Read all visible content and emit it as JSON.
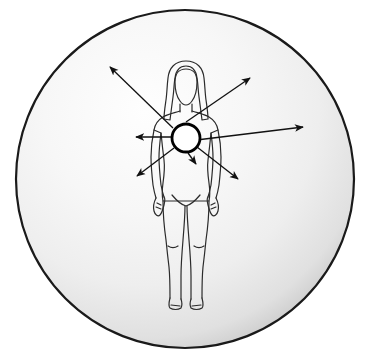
{
  "figure": {
    "kind": "anatomical-diagram",
    "canvas": {
      "width": 375,
      "height": 360,
      "background": "#ffffff"
    }
  },
  "aura_sphere": {
    "name": "aura-sphere",
    "center": {
      "x": 185,
      "y": 179
    },
    "radius": 169,
    "stroke_color": "#1a1a1a",
    "stroke_width": 2.2,
    "fill_light": "#fdfdfd",
    "fill_mid": "#f0f0f0",
    "fill_dark": "#c9c9c9",
    "highlight": {
      "x": 150,
      "y": 120
    }
  },
  "body_figure": {
    "name": "female-body-outline",
    "stroke_color": "#2b2b2b",
    "stroke_width": 1.2,
    "fill": "none",
    "head_center": {
      "x": 186,
      "y": 88
    },
    "feet_y": 308,
    "parts": [
      "head",
      "hair",
      "neck",
      "shoulders",
      "torso",
      "left-arm",
      "right-arm",
      "left-hand",
      "right-hand",
      "hips",
      "left-leg",
      "right-leg",
      "left-foot",
      "right-foot"
    ]
  },
  "energy_center": {
    "name": "solar-plexus-circle",
    "center": {
      "x": 186,
      "y": 138
    },
    "radius": 14,
    "stroke_color": "#000000",
    "stroke_width": 2.8,
    "fill": "#ffffff"
  },
  "rays": {
    "name": "radiating-arrows",
    "stroke_color": "#111111",
    "stroke_width": 1.3,
    "head_length": 8,
    "head_width": 5,
    "items": [
      {
        "id": "ray-upper-left",
        "label": "upper-left ray",
        "from": {
          "x": 173,
          "y": 128
        },
        "to": {
          "x": 110,
          "y": 67
        }
      },
      {
        "id": "ray-left",
        "label": "left ray",
        "from": {
          "x": 171,
          "y": 137
        },
        "to": {
          "x": 136,
          "y": 137
        }
      },
      {
        "id": "ray-lower-left",
        "label": "lower-left ray",
        "from": {
          "x": 174,
          "y": 148
        },
        "to": {
          "x": 137,
          "y": 176
        }
      },
      {
        "id": "ray-down",
        "label": "downward ray",
        "from": {
          "x": 188,
          "y": 153
        },
        "to": {
          "x": 196,
          "y": 164
        }
      },
      {
        "id": "ray-lower-right",
        "label": "lower-right ray",
        "from": {
          "x": 197,
          "y": 147
        },
        "to": {
          "x": 238,
          "y": 179
        }
      },
      {
        "id": "ray-right",
        "label": "right ray",
        "from": {
          "x": 172,
          "y": 143
        },
        "to": {
          "x": 303,
          "y": 127
        }
      },
      {
        "id": "ray-upper-right",
        "label": "upper-right ray",
        "from": {
          "x": 186,
          "y": 122
        },
        "to": {
          "x": 250,
          "y": 78
        }
      }
    ]
  }
}
